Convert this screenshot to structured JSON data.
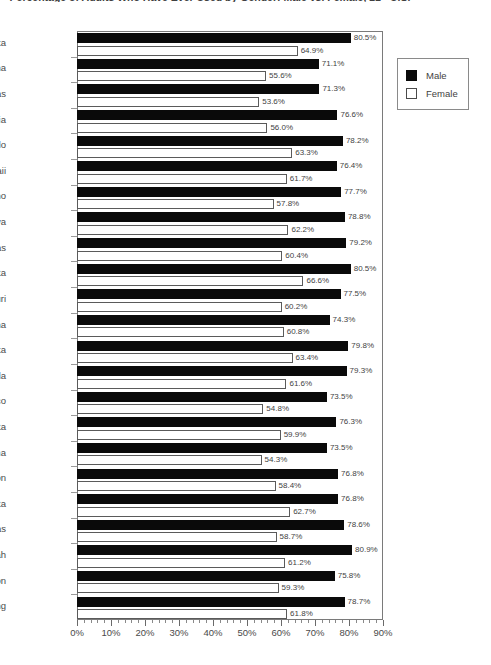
{
  "chart_data": {
    "type": "bar",
    "orientation": "horizontal",
    "title": "Percentage of Adults Who Have Ever Used by Gender: Male vs. Female, 21+ U.S.",
    "xlabel": "",
    "ylabel": "",
    "xlim": [
      0,
      90
    ],
    "xticks": [
      "0%",
      "10%",
      "20%",
      "30%",
      "40%",
      "50%",
      "60%",
      "70%",
      "80%",
      "90%"
    ],
    "xtick_values": [
      0,
      10,
      20,
      30,
      40,
      50,
      60,
      70,
      80,
      90
    ],
    "minor_tick_step": 2,
    "grid": false,
    "legend_position": "right-top",
    "value_suffix": "%",
    "categories": [
      "Alaska",
      "Arizona",
      "Arkansas",
      "California",
      "Colorado",
      "Hawaii",
      "Idaho",
      "Iowa",
      "Kansas",
      "Minnesota",
      "Missouri",
      "Montana",
      "Nebraska",
      "Nevada",
      "New Mexico",
      "North Dakota",
      "Oklahoma",
      "Oregon",
      "South Dakota",
      "Texas",
      "Utah",
      "Washington",
      "Wyoming"
    ],
    "series": [
      {
        "name": "Male",
        "color": "#000000",
        "values": [
          80.5,
          71.1,
          71.3,
          76.6,
          78.2,
          76.4,
          77.7,
          78.8,
          79.2,
          80.5,
          77.5,
          74.3,
          79.8,
          79.3,
          73.5,
          76.3,
          73.5,
          76.8,
          76.8,
          78.6,
          80.9,
          75.8,
          78.7
        ],
        "labels": [
          "80.5%",
          "71.1%",
          "71.3%",
          "76.6%",
          "78.2%",
          "76.4%",
          "77.7%",
          "78.8%",
          "79.2%",
          "80.5%",
          "77.5%",
          "74.3%",
          "79.8%",
          "79.3%",
          "73.5%",
          "76.3%",
          "73.5%",
          "76.8%",
          "76.8%",
          "78.6%",
          "80.9%",
          "75.8%",
          "78.7%"
        ]
      },
      {
        "name": "Female",
        "color": "#FFFFFF",
        "values": [
          64.9,
          55.6,
          53.6,
          56.0,
          63.3,
          61.7,
          57.8,
          62.2,
          60.4,
          66.6,
          60.2,
          60.8,
          63.4,
          61.6,
          54.8,
          59.9,
          54.3,
          58.4,
          62.7,
          58.7,
          61.2,
          59.3,
          61.8
        ],
        "labels": [
          "64.9%",
          "55.6%",
          "53.6%",
          "56.0%",
          "63.3%",
          "61.7%",
          "57.8%",
          "62.2%",
          "60.4%",
          "66.6%",
          "60.2%",
          "60.8%",
          "63.4%",
          "61.6%",
          "54.8%",
          "59.9%",
          "54.3%",
          "58.4%",
          "62.7%",
          "58.7%",
          "61.2%",
          "59.3%",
          "61.8%"
        ]
      }
    ]
  },
  "legend": {
    "items": [
      {
        "label": "Male",
        "swatch": "filled-black-square"
      },
      {
        "label": "Female",
        "swatch": "outlined-white-square"
      }
    ]
  }
}
